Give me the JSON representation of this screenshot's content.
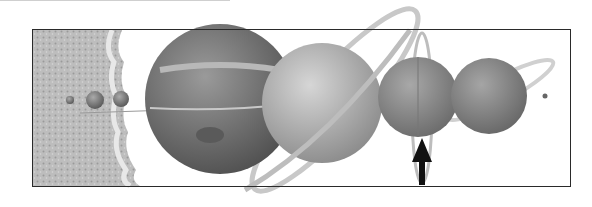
{
  "figure": {
    "style": "grayscale",
    "colors": {
      "frame": "#2a2a2a",
      "background": "#ffffff",
      "arrow": "#111111"
    },
    "bodies": [
      {
        "name": "Sun",
        "cx": 40,
        "cy": 108,
        "r": 0
      },
      {
        "name": "Mercury",
        "cx": 70,
        "cy": 100,
        "r": 4
      },
      {
        "name": "Venus",
        "cx": 95,
        "cy": 100,
        "r": 9
      },
      {
        "name": "Earth",
        "cx": 121,
        "cy": 99,
        "r": 8
      },
      {
        "name": "Mars",
        "cx": 151,
        "cy": 99,
        "r": 5
      },
      {
        "name": "Jupiter",
        "cx": 220,
        "cy": 99,
        "r": 75
      },
      {
        "name": "Saturn",
        "cx": 322,
        "cy": 103,
        "r": 60
      },
      {
        "name": "Uranus",
        "cx": 418,
        "cy": 97,
        "r": 40
      },
      {
        "name": "Neptune",
        "cx": 489,
        "cy": 96,
        "r": 38
      },
      {
        "name": "Pluto",
        "cx": 545,
        "cy": 96,
        "r": 2.5
      }
    ],
    "pointer": {
      "target": "Uranus",
      "direction": "up"
    }
  }
}
